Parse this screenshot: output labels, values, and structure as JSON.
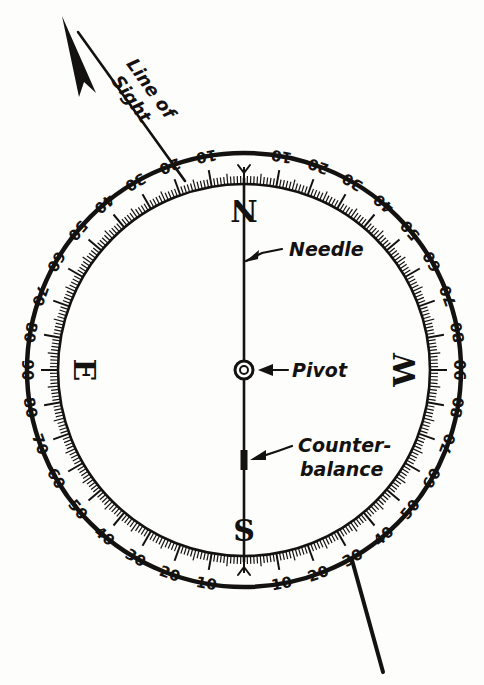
{
  "figure": {
    "type": "surveyors-compass-diagram",
    "background": "#fdfdfb",
    "ink_color": "#141210"
  },
  "annotations": {
    "line_of_sight": {
      "line1": "Line of",
      "line2": "Sight"
    },
    "needle": "Needle",
    "pivot": "Pivot",
    "counterbalance": {
      "line1": "Counter-",
      "line2": "balance"
    }
  },
  "compass": {
    "center": {
      "x": 244,
      "y": 370
    },
    "outer_radius": 218,
    "ring_inner_radius": 186,
    "graduation_radius": 186,
    "cardinals": [
      {
        "label": "N",
        "angle_deg": 0
      },
      {
        "label": "W",
        "angle_deg": 90
      },
      {
        "label": "S",
        "angle_deg": 180
      },
      {
        "label": "E",
        "angle_deg": 270
      }
    ],
    "fleur_markers_at_deg": [
      0,
      180
    ],
    "quadrant_scale": {
      "major_step": 10,
      "minor_step": 1,
      "pattern": "0 to 90 and back to 0 in each quadrant",
      "labels": [
        10,
        20,
        30,
        40,
        50,
        60,
        70,
        80,
        90,
        80,
        70,
        60,
        50,
        40,
        30,
        20,
        10
      ]
    },
    "needle": {
      "points_to_deg": 0,
      "top_y": 178,
      "bottom_y": 562,
      "counterbalance_y": 460
    },
    "pivot": {
      "outer_r": 9,
      "inner_r": 4
    }
  },
  "sight_line": {
    "arrow_tip": {
      "x": 62,
      "y": 16
    },
    "through": {
      "x": 176,
      "y": 170
    },
    "lower_end": {
      "x": 383,
      "y": 672
    }
  },
  "chart_data": {
    "type": "table",
    "categories": [
      "N",
      "W",
      "S",
      "E"
    ],
    "values": [
      0,
      90,
      180,
      270
    ],
    "xlabel": "Cardinal point",
    "ylabel": "Dial bearing (degrees)"
  }
}
